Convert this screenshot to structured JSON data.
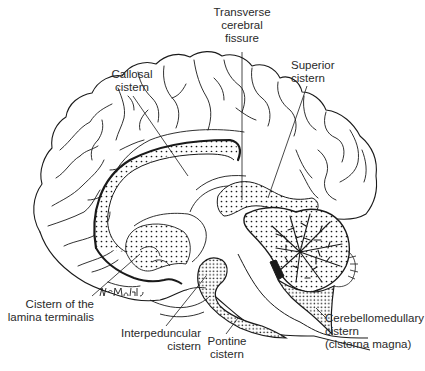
{
  "figure": {
    "signature": "McMahle",
    "colors": {
      "line": "#1a1a1a",
      "background": "#ffffff",
      "label_text": "#2a2a2a"
    }
  },
  "labels": {
    "transverse_fissure": "Transverse\ncerebral\nfissure",
    "superior_cistern": "Superior\ncistern",
    "callosal_cistern": "Callosal\ncistern",
    "lamina_terminalis": "Cistern of the\nlamina terminalis",
    "interpeduncular": "Interpeduncular\ncistern",
    "pontine": "Pontine\ncistern",
    "cerebellomedullary": "Cerebellomedullary\ncistern\n(cisterna magna)"
  }
}
